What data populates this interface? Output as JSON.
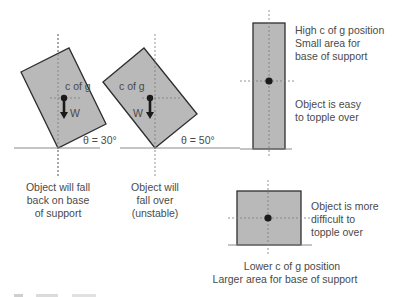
{
  "panels": [
    {
      "id": "tilt-30",
      "cg_label": "c of g",
      "weight_label": "W",
      "angle_label": "θ = 30°",
      "caption": [
        "Object will fall",
        "back on base",
        "of support"
      ]
    },
    {
      "id": "tilt-50",
      "cg_label": "c of g",
      "weight_label": "W",
      "angle_label": "θ = 50°",
      "caption": [
        "Object will",
        "fall over",
        "(unstable)"
      ]
    },
    {
      "id": "tall-object",
      "notes_top": [
        "High c of g position",
        "Small area for",
        "base of support"
      ],
      "notes_bottom": [
        "Object is easy",
        "to topple over"
      ]
    },
    {
      "id": "wide-object",
      "notes_right": [
        "Object is more",
        "difficult to",
        "topple over"
      ],
      "caption": [
        "Lower c of g position",
        "Larger area for base of support"
      ]
    }
  ],
  "colors": {
    "shape_fill": "#b9b9b9",
    "shape_stroke": "#2e2e2e",
    "text": "#4a4a4a"
  }
}
